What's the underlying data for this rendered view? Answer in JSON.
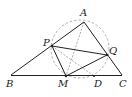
{
  "diagram": {
    "type": "geometry",
    "points": {
      "A": {
        "label": "A",
        "x": 84,
        "y": 22,
        "lx": 80,
        "ly": 16
      },
      "B": {
        "label": "B",
        "x": 11,
        "y": 75,
        "lx": 6,
        "ly": 87
      },
      "C": {
        "label": "C",
        "x": 122,
        "y": 75,
        "lx": 119,
        "ly": 87
      },
      "P": {
        "label": "P",
        "x": 52,
        "y": 46,
        "lx": 43,
        "ly": 46
      },
      "Q": {
        "label": "Q",
        "x": 107,
        "y": 55,
        "lx": 109,
        "ly": 53
      },
      "M": {
        "label": "M",
        "x": 66,
        "y": 76,
        "lx": 58,
        "ly": 87
      },
      "D": {
        "label": "D",
        "x": 94,
        "y": 76,
        "lx": 94,
        "ly": 87
      }
    },
    "circle": {
      "cx": 80,
      "cy": 49,
      "r": 29,
      "style": "dashed"
    },
    "solid_segments": [
      "BA",
      "AC",
      "BC",
      "PQ",
      "PM",
      "MQ"
    ],
    "dashed_segments": [
      "AM",
      "PD"
    ],
    "colors": {
      "line": "#222222",
      "dashed": "#888888"
    }
  }
}
